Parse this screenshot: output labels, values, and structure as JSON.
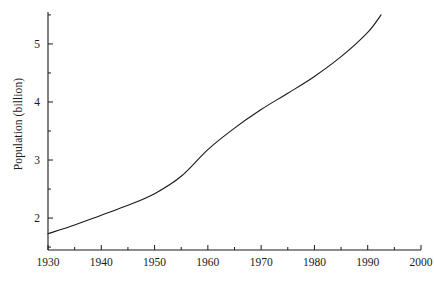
{
  "chart_data": {
    "type": "line",
    "title": "",
    "xlabel": "",
    "ylabel": "Population (billion)",
    "xlim": [
      1930,
      2000
    ],
    "ylim": [
      1.45,
      5.55
    ],
    "grid": false,
    "legend": "none",
    "x_ticks": [
      1930,
      1940,
      1950,
      1960,
      1970,
      1980,
      1990,
      2000
    ],
    "x_tick_labels": [
      "1930",
      "1940",
      "1950",
      "1960",
      "1970",
      "1980",
      "1990",
      "2000"
    ],
    "x_minor_ticks": [
      1935,
      1945,
      1955,
      1965,
      1975,
      1985,
      1995
    ],
    "y_ticks": [
      2,
      3,
      4,
      5
    ],
    "y_tick_labels": [
      "2",
      "3",
      "4",
      "5"
    ],
    "y_minor_ticks": [
      1.5,
      2.5,
      3.5,
      4.5,
      5.5
    ],
    "series": [
      {
        "name": "World population",
        "color": "#1a1a1a",
        "x": [
          1930,
          1935,
          1940,
          1945,
          1950,
          1955,
          1960,
          1965,
          1970,
          1975,
          1980,
          1985,
          1990,
          1992.5
        ],
        "values": [
          1.73,
          1.88,
          2.05,
          2.22,
          2.42,
          2.72,
          3.18,
          3.55,
          3.87,
          4.15,
          4.44,
          4.78,
          5.2,
          5.5
        ]
      }
    ]
  }
}
